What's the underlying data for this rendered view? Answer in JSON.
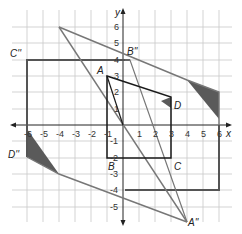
{
  "diagram": {
    "type": "coordinate-plane transformation",
    "axes": {
      "x_label": "x",
      "y_label": "y",
      "x_ticks": [
        "-6",
        "-5",
        "-4",
        "-3",
        "-2",
        "-1",
        "1",
        "2",
        "3",
        "4",
        "5",
        "6"
      ],
      "y_ticks": [
        "6",
        "5",
        "4",
        "3",
        "2",
        "1",
        "-1",
        "-2",
        "-3",
        "-4",
        "-5"
      ]
    },
    "points": {
      "A": {
        "label": "A",
        "x": -1,
        "y": 3
      },
      "B": {
        "label": "B",
        "x": -1,
        "y": -2
      },
      "C": {
        "label": "C",
        "x": 3,
        "y": -2
      },
      "D": {
        "label": "D",
        "x": 3,
        "y": 1
      },
      "A2": {
        "label": "A''",
        "x": 4,
        "y": -6
      },
      "B2": {
        "label": "B''",
        "x": 0,
        "y": 4
      },
      "C2": {
        "label": "C''",
        "x": -6,
        "y": 4
      },
      "D2": {
        "label": "D''",
        "x": -6,
        "y": -2
      }
    },
    "colors": {
      "original": "#1a1a1a",
      "image_rect": "#555555",
      "image_parallelogram": "#777777",
      "shade": "#5a5a5a",
      "grid": "#c8c8c8"
    }
  }
}
